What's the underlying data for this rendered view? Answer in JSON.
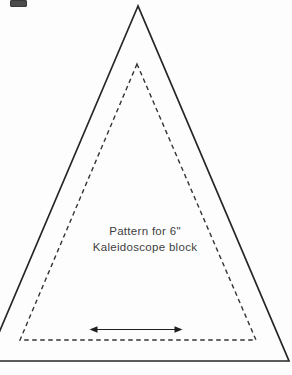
{
  "page": {
    "background": "#fdfdfd"
  },
  "colors": {
    "outer_line": "#262626",
    "inner_line": "#333333",
    "arrow": "#1f1f1f",
    "text": "#3f3f3f",
    "ui_fragment": "#4c4c4c"
  },
  "pattern": {
    "label_line1": "Pattern for 6\"",
    "label_line2": "Kaleidoscope block"
  },
  "icons": {
    "grainline_arrow": "double-headed-horizontal-arrow",
    "ui_fragment": "cropped-dark-rectangle"
  }
}
